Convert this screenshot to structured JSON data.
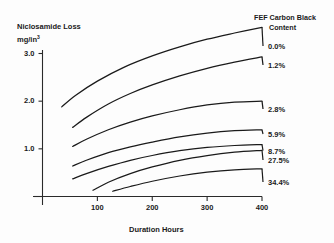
{
  "chart_data": {
    "type": "line",
    "title": "",
    "ylabel": "Niclosamide Loss",
    "yunits": "mg/in",
    "yunits_exp": "3",
    "xlabel": "Duration Hours",
    "xlim": [
      0,
      400
    ],
    "ylim": [
      0,
      3.0
    ],
    "grid": false,
    "legend_position": "right",
    "legend_title_line1": "FEF Carbon Black",
    "legend_title_line2": "Content",
    "xticks": [
      "100",
      "200",
      "300",
      "400"
    ],
    "xtick_values": [
      100,
      200,
      300,
      400
    ],
    "yticks": [
      "3.0",
      "2.0",
      "1.0"
    ],
    "ytick_values": [
      3.0,
      2.0,
      1.0
    ],
    "series": [
      {
        "name": "0.0%",
        "label": "0.0%",
        "x": [
          35,
          60,
          100,
          150,
          200,
          250,
          300,
          350,
          400
        ],
        "values": [
          1.88,
          2.12,
          2.42,
          2.72,
          2.95,
          3.14,
          3.3,
          3.43,
          3.55
        ]
      },
      {
        "name": "1.2%",
        "label": "1.2%",
        "x": [
          55,
          80,
          120,
          160,
          200,
          250,
          300,
          350,
          400
        ],
        "values": [
          1.45,
          1.66,
          1.94,
          2.16,
          2.34,
          2.53,
          2.69,
          2.82,
          2.93
        ]
      },
      {
        "name": "2.8%",
        "label": "2.8%",
        "x": [
          55,
          80,
          120,
          160,
          200,
          250,
          300,
          350,
          400
        ],
        "values": [
          1.05,
          1.2,
          1.4,
          1.56,
          1.69,
          1.82,
          1.92,
          1.98,
          2.0
        ]
      },
      {
        "name": "5.9%",
        "label": "5.9%",
        "x": [
          55,
          80,
          120,
          160,
          200,
          250,
          300,
          350,
          400
        ],
        "values": [
          0.64,
          0.76,
          0.92,
          1.04,
          1.14,
          1.25,
          1.33,
          1.38,
          1.4
        ]
      },
      {
        "name": "8.7%",
        "label": "8.7%",
        "x": [
          55,
          80,
          120,
          160,
          200,
          250,
          300,
          350,
          400
        ],
        "values": [
          0.37,
          0.48,
          0.63,
          0.76,
          0.86,
          0.96,
          1.03,
          1.07,
          1.09
        ]
      },
      {
        "name": "27.5%",
        "label": "27.5%",
        "x": [
          92,
          120,
          160,
          200,
          250,
          300,
          350,
          400
        ],
        "values": [
          0.13,
          0.3,
          0.48,
          0.62,
          0.76,
          0.86,
          0.93,
          0.97
        ]
      },
      {
        "name": "34.4%",
        "label": "34.4%",
        "x": [
          128,
          160,
          200,
          250,
          300,
          350,
          400
        ],
        "values": [
          0.11,
          0.21,
          0.32,
          0.43,
          0.51,
          0.56,
          0.58
        ]
      }
    ]
  },
  "axis": {
    "y_tick_labels": [
      "3.0",
      "2.0",
      "1.0"
    ],
    "x_tick_labels": [
      "100",
      "200",
      "300",
      "400"
    ]
  }
}
